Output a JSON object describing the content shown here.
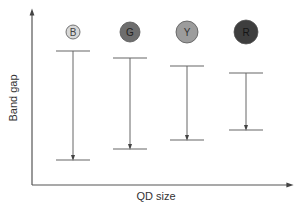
{
  "diagram": {
    "xlabel": "QD size",
    "ylabel": "Band gap",
    "axis_color": "#555555",
    "line_color": "#666666",
    "items": [
      {
        "label": "B",
        "fill": "#d8d8d8",
        "text_color": "#444444",
        "x": 73,
        "cy": 32,
        "r": 7,
        "top": 51,
        "bottom": 160
      },
      {
        "label": "G",
        "fill": "#6e6e6e",
        "text_color": "#222222",
        "x": 130,
        "cy": 32,
        "r": 10,
        "top": 58,
        "bottom": 149
      },
      {
        "label": "Y",
        "fill": "#9c9c9c",
        "text_color": "#333333",
        "x": 187,
        "cy": 32,
        "r": 11,
        "top": 66,
        "bottom": 140
      },
      {
        "label": "R",
        "fill": "#3e3e3e",
        "text_color": "#151515",
        "x": 246,
        "cy": 32,
        "r": 12,
        "top": 73,
        "bottom": 130
      }
    ]
  },
  "chart_data": {
    "type": "diagram",
    "title": "",
    "xlabel": "QD size",
    "ylabel": "Band gap",
    "categories": [
      "B",
      "G",
      "Y",
      "R"
    ],
    "relative_band_gap": [
      109,
      91,
      74,
      57
    ],
    "note": "Band gap decreases with increasing QD size (Blue > Green > Yellow > Red)"
  }
}
